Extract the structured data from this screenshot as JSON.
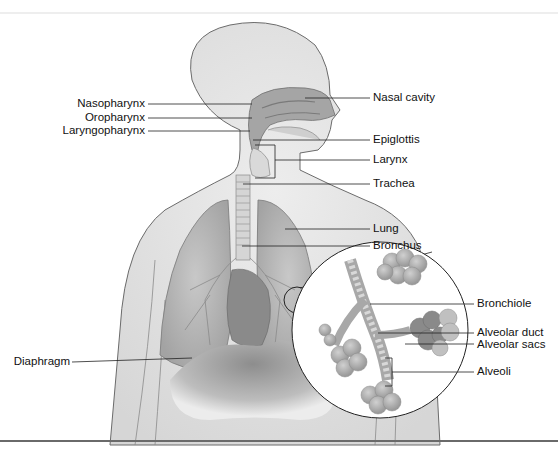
{
  "figure": {
    "colors": {
      "skin": "#e4e4e4",
      "skin_outline": "#6b6b6b",
      "lung": "#bdbdbd",
      "lung_dark": "#8e8e8e",
      "heart": "#8a8a8a",
      "airway": "#d6d6d6",
      "label_line": "#222222",
      "alveoli": "#b0b0b0",
      "alveoli_dark": "#7e7e7e"
    },
    "labels_left": [
      {
        "id": "nasopharynx",
        "text": "Nasopharynx"
      },
      {
        "id": "oropharynx",
        "text": "Oropharynx"
      },
      {
        "id": "laryngopharynx",
        "text": "Laryngopharynx"
      },
      {
        "id": "diaphragm",
        "text": "Diaphragm"
      }
    ],
    "labels_right": [
      {
        "id": "nasal-cavity",
        "text": "Nasal cavity"
      },
      {
        "id": "epiglottis",
        "text": "Epiglottis"
      },
      {
        "id": "larynx",
        "text": "Larynx"
      },
      {
        "id": "trachea",
        "text": "Trachea"
      },
      {
        "id": "lung",
        "text": "Lung"
      },
      {
        "id": "bronchus",
        "text": "Bronchus"
      }
    ],
    "labels_inset": [
      {
        "id": "bronchiole",
        "text": "Bronchiole"
      },
      {
        "id": "alveolar-duct",
        "text": "Alveolar duct"
      },
      {
        "id": "alveolar-sacs",
        "text": "Alveolar sacs"
      },
      {
        "id": "alveoli",
        "text": "Alveoli"
      }
    ]
  }
}
